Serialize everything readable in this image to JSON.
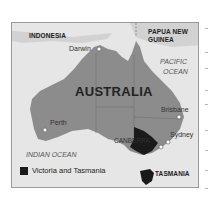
{
  "map": {
    "title": "AUSTRALIA",
    "countries": [
      "INDONESIA",
      "PAPUA NEW GUINEA"
    ],
    "png_line1": "PAPUA NEW",
    "png_line2": "GUINEA",
    "oceans": {
      "pacific_line1": "PACIFIC",
      "pacific_line2": "OCEAN",
      "indian": "INDIAN OCEAN"
    },
    "cities": {
      "darwin": "Darwin",
      "perth": "Perth",
      "brisbane": "Brisbane",
      "sydney": "Sydney",
      "canberra": "CANBERRA"
    },
    "highlighted_region_label": "TASMANIA",
    "legend": {
      "label": "Victoria and Tasmania",
      "color": "#1a1a1a"
    },
    "colors": {
      "land": "#8c8c8c",
      "sea": "#e6e6e6",
      "highlight": "#1a1a1a"
    }
  }
}
